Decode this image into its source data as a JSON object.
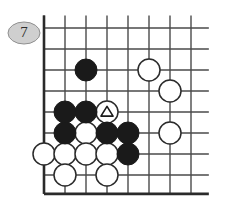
{
  "diagram": {
    "type": "go-board-problem",
    "move_number_badge": "7",
    "badge_fill": "#cfcfcf",
    "badge_stroke": "#8f8f8f",
    "board": {
      "corner": "bottom-left",
      "columns": 8,
      "rows": 8,
      "grid_color": "#4a4a4a",
      "border_color": "#2a2a2a",
      "cell_size": 21,
      "origin_x": 44,
      "origin_y": 28,
      "background": "#ffffff"
    },
    "stones": {
      "black_color": "#1a1a1a",
      "white_fill": "#ffffff",
      "white_stroke": "#2a2a2a",
      "radius": 11,
      "black": [
        {
          "col": 2,
          "row": 2,
          "label": ""
        },
        {
          "col": 1,
          "row": 4,
          "label": ""
        },
        {
          "col": 2,
          "row": 4,
          "label": ""
        },
        {
          "col": 1,
          "row": 5,
          "label": ""
        },
        {
          "col": 3,
          "row": 5,
          "label": ""
        },
        {
          "col": 4,
          "row": 5,
          "label": ""
        },
        {
          "col": 4,
          "row": 6,
          "label": ""
        }
      ],
      "white": [
        {
          "col": 5,
          "row": 2,
          "label": "",
          "mark": ""
        },
        {
          "col": 6,
          "row": 3,
          "label": "",
          "mark": ""
        },
        {
          "col": 3,
          "row": 4,
          "label": "",
          "mark": "triangle"
        },
        {
          "col": 2,
          "row": 5,
          "label": "",
          "mark": ""
        },
        {
          "col": 6,
          "row": 5,
          "label": "",
          "mark": ""
        },
        {
          "col": 0,
          "row": 6,
          "label": "",
          "mark": ""
        },
        {
          "col": 1,
          "row": 6,
          "label": "",
          "mark": ""
        },
        {
          "col": 2,
          "row": 6,
          "label": "",
          "mark": ""
        },
        {
          "col": 3,
          "row": 6,
          "label": "",
          "mark": ""
        },
        {
          "col": 1,
          "row": 7,
          "label": "",
          "mark": ""
        },
        {
          "col": 3,
          "row": 7,
          "label": "",
          "mark": ""
        }
      ]
    },
    "marks": {
      "triangle_stroke": "#1a1a1a",
      "triangle_size": 11
    }
  }
}
